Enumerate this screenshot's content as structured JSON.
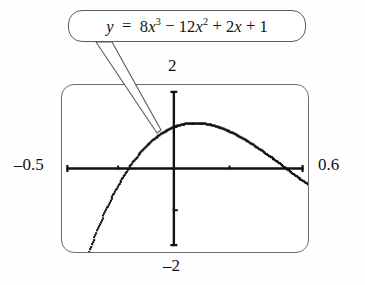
{
  "figure": {
    "kind": "graphing-calculator-screen",
    "equation": {
      "lhs": "y",
      "equals": "=",
      "terms": [
        {
          "coefficient": "8",
          "variable": "x",
          "exponent": "3"
        },
        {
          "sign": "−",
          "coefficient": "12",
          "variable": "x",
          "exponent": "2"
        },
        {
          "sign": "+",
          "coefficient": "2",
          "variable": "x",
          "exponent": ""
        },
        {
          "sign": "+",
          "coefficient": "1",
          "variable": "",
          "exponent": ""
        }
      ],
      "plain_text": "y = 8x^3 - 12x^2 + 2x + 1"
    },
    "window_labels": {
      "xmin": "–0.5",
      "xmax": "0.6",
      "ymin": "–2",
      "ymax": "2"
    }
  },
  "chart_data": {
    "type": "line",
    "xlabel": "",
    "ylabel": "",
    "xlim": [
      -0.5,
      0.6
    ],
    "ylim": [
      -2,
      2
    ],
    "grid": false,
    "legend": null,
    "axes": {
      "x_axis_drawn": true,
      "y_axis_drawn": true,
      "x_tick_positions": [
        -0.25,
        0.25
      ],
      "y_tick_positions": [
        -1,
        1
      ],
      "tick_style": "small-hash-marks"
    },
    "line_style": "dotted-pixel-trace",
    "color": "#111111",
    "series": [
      {
        "name": "y = 8x^3 - 12x^2 + 2x + 1",
        "x": [
          -0.5,
          -0.46,
          -0.42,
          -0.38,
          -0.34,
          -0.3,
          -0.26,
          -0.22,
          -0.18,
          -0.14,
          -0.1,
          -0.06,
          -0.02,
          0.02,
          0.06,
          0.1,
          0.14,
          0.18,
          0.22,
          0.26,
          0.3,
          0.34,
          0.38,
          0.42,
          0.46,
          0.5,
          0.54,
          0.58,
          0.6
        ],
        "y": [
          -4.0,
          -3.34,
          -2.75,
          -2.22,
          -1.76,
          -1.36,
          -1.03,
          -0.75,
          -0.53,
          -0.36,
          -0.24,
          -0.16,
          -0.11,
          0.03,
          0.08,
          0.1,
          0.09,
          0.06,
          0.01,
          -0.06,
          -0.16,
          -0.28,
          -0.43,
          -0.61,
          -0.81,
          -1.05,
          -1.32,
          -1.63,
          -1.8
        ],
        "annotations": [
          {
            "label": "local maximum",
            "x": 0.09,
            "y": 0.1
          },
          {
            "label": "x-intercept (left)",
            "x": -0.01,
            "y": 0
          },
          {
            "label": "x-intercept (right)",
            "x": 0.43,
            "y": 0
          }
        ]
      }
    ]
  },
  "callout": {
    "shape": "rounded-rectangle",
    "pointer": "tapered-leader-line",
    "pointer_target": {
      "x": 0.02,
      "y": 0.45
    }
  }
}
